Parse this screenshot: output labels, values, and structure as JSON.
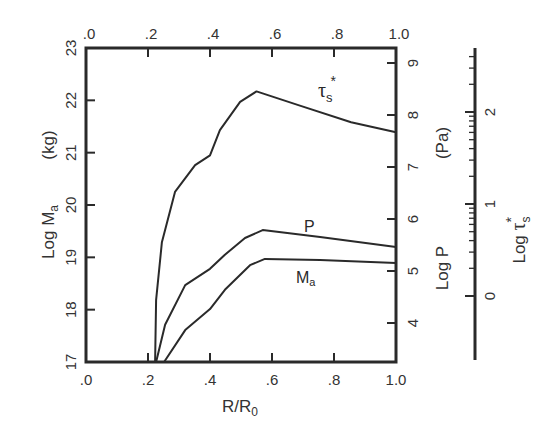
{
  "chart_data": {
    "type": "line",
    "title": "",
    "xlabel": "R/R0",
    "xlim": [
      0.0,
      1.0
    ],
    "x_ticks": [
      ".0",
      ".2",
      ".4",
      ".6",
      ".8",
      "1.0"
    ],
    "top_x_ticks": [
      ".0",
      ".2",
      ".4",
      ".6",
      ".8",
      "1.0"
    ],
    "left_axis": {
      "label": "Log Ma",
      "unit": "(kg)",
      "ylim": [
        17,
        23
      ],
      "ticks": [
        "17",
        "18",
        "19",
        "20",
        "21",
        "22",
        "23"
      ]
    },
    "right_axis": {
      "label": "Log P",
      "unit": "(Pa)",
      "ticks": [
        "4",
        "5",
        "6",
        "7",
        "8",
        "9"
      ]
    },
    "far_right_axis": {
      "label": "Log τs*",
      "scale": "log",
      "ticks": [
        "0",
        "1",
        "2"
      ]
    },
    "grid": false,
    "legend": "inline curve labels",
    "series": [
      {
        "name": "τs*",
        "label": "τ",
        "label_sub": "s",
        "label_sup": "*",
        "x": [
          0.223,
          0.226,
          0.245,
          0.287,
          0.352,
          0.4,
          0.432,
          0.497,
          0.55,
          0.69,
          0.855,
          1.0
        ],
        "y_log_Ma_equiv": [
          17.0,
          18.18,
          19.29,
          20.25,
          20.76,
          20.95,
          21.43,
          21.97,
          22.17,
          21.9,
          21.58,
          21.39
        ]
      },
      {
        "name": "P",
        "label": "P",
        "x": [
          0.226,
          0.255,
          0.32,
          0.4,
          0.448,
          0.513,
          0.57,
          0.755,
          1.0
        ],
        "y_log_Ma_equiv": [
          17.0,
          17.71,
          18.47,
          18.78,
          19.05,
          19.37,
          19.52,
          19.39,
          19.2
        ],
        "y_log_P": [
          3.27,
          3.98,
          4.75,
          5.06,
          5.33,
          5.66,
          5.81,
          5.67,
          5.48
        ]
      },
      {
        "name": "Ma",
        "label": "M",
        "label_sub": "a",
        "x": [
          0.252,
          0.32,
          0.4,
          0.448,
          0.529,
          0.577,
          0.755,
          1.0
        ],
        "y_log_Ma": [
          17.0,
          17.61,
          18.01,
          18.38,
          18.85,
          18.97,
          18.95,
          18.89
        ]
      }
    ]
  },
  "labels": {
    "x_axis_title": "R/R",
    "x_axis_sub": "0",
    "left_title": "Log M",
    "left_title_sub": "a",
    "left_unit": "(kg)",
    "right_title": "Log P",
    "right_unit": "(Pa)",
    "far_right_title": "Log ",
    "far_right_tau": "τ",
    "far_right_sub": "s",
    "far_right_sup": "*"
  }
}
